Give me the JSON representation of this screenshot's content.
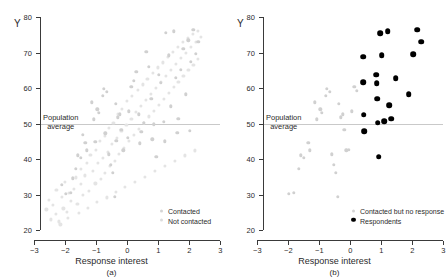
{
  "figure": {
    "background": "#ffffff",
    "panels": [
      {
        "id": "a",
        "caption": "(a)",
        "xlabel": "Response interest",
        "ylabel": "Y",
        "reference_label_line1": "Population",
        "reference_label_line2": "average",
        "legend": [
          {
            "label": "Contacted",
            "marker": "gray-dot",
            "color": "#d0d0d0"
          },
          {
            "label": "Not contacted",
            "marker": "faint-dot",
            "color": "#e4e4e4"
          }
        ]
      },
      {
        "id": "b",
        "caption": "(b)",
        "xlabel": "Response interest",
        "ylabel": "Y",
        "reference_label_line1": "Population",
        "reference_label_line2": "average",
        "legend": [
          {
            "label": "Contacted but no response",
            "marker": "gray-dot",
            "color": "#d0d0d0"
          },
          {
            "label": "Respondents",
            "marker": "black-dot",
            "color": "#000000"
          }
        ]
      }
    ]
  },
  "chart_data": [
    {
      "type": "scatter",
      "panel": "a",
      "title": "",
      "xlabel": "Response interest",
      "ylabel": "Y",
      "xlim": [
        -3,
        3
      ],
      "ylim": [
        20,
        80
      ],
      "xticks": [
        -3,
        -2,
        -1,
        0,
        1,
        2,
        3
      ],
      "xticklabels": [
        "−3",
        "−2",
        "−1",
        "0",
        "1",
        "2",
        "3"
      ],
      "yticks": [
        20,
        30,
        40,
        50,
        60,
        70,
        80
      ],
      "yticklabels": [
        "20",
        "30",
        "40",
        "50",
        "60",
        "70",
        "80"
      ],
      "grid": false,
      "legend_position": "lower-right",
      "annotations": [
        {
          "type": "hline",
          "y": 50,
          "label": "Population average",
          "color": "#c9c9c9"
        }
      ],
      "series": [
        {
          "name": "Not contacted",
          "color": "#e4e4e4",
          "marker": "o",
          "points": [
            [
              -2.45,
              23.0
            ],
            [
              -2.3,
              24.6
            ],
            [
              -2.2,
              22.4
            ],
            [
              -2.05,
              26.1
            ],
            [
              -2.38,
              27.0
            ],
            [
              -2.1,
              29.4
            ],
            [
              -1.95,
              25.0
            ],
            [
              -1.8,
              28.2
            ],
            [
              -1.7,
              31.5
            ],
            [
              -1.6,
              27.4
            ],
            [
              -1.5,
              33.0
            ],
            [
              -1.42,
              29.8
            ],
            [
              -1.35,
              35.4
            ],
            [
              -1.22,
              31.0
            ],
            [
              -1.1,
              36.6
            ],
            [
              -1.02,
              33.1
            ],
            [
              -0.95,
              38.8
            ],
            [
              -0.85,
              34.4
            ],
            [
              -0.78,
              40.4
            ],
            [
              -0.7,
              36.0
            ],
            [
              -0.62,
              42.1
            ],
            [
              -0.55,
              38.0
            ],
            [
              -0.48,
              44.2
            ],
            [
              -0.4,
              39.5
            ],
            [
              -0.32,
              46.0
            ],
            [
              -0.25,
              41.4
            ],
            [
              -0.18,
              47.8
            ],
            [
              -0.1,
              43.2
            ],
            [
              -0.02,
              49.6
            ],
            [
              0.06,
              45.0
            ],
            [
              0.14,
              51.4
            ],
            [
              0.22,
              46.8
            ],
            [
              0.3,
              53.2
            ],
            [
              0.38,
              48.4
            ],
            [
              0.46,
              55.0
            ],
            [
              0.54,
              50.2
            ],
            [
              0.62,
              56.6
            ],
            [
              0.7,
              52.0
            ],
            [
              0.78,
              58.4
            ],
            [
              0.86,
              53.6
            ],
            [
              0.94,
              60.0
            ],
            [
              1.02,
              55.2
            ],
            [
              1.1,
              61.8
            ],
            [
              1.18,
              57.0
            ],
            [
              1.26,
              63.4
            ],
            [
              1.34,
              58.6
            ],
            [
              1.42,
              65.2
            ],
            [
              1.5,
              60.2
            ],
            [
              1.58,
              66.8
            ],
            [
              1.66,
              61.8
            ],
            [
              1.74,
              68.4
            ],
            [
              1.82,
              63.4
            ],
            [
              1.9,
              70.0
            ],
            [
              1.98,
              65.0
            ],
            [
              2.06,
              71.6
            ],
            [
              2.14,
              66.6
            ],
            [
              2.22,
              73.0
            ],
            [
              2.3,
              68.2
            ],
            [
              2.38,
              74.4
            ],
            [
              -2.6,
              25.8
            ],
            [
              -2.52,
              28.4
            ],
            [
              -2.28,
              31.2
            ],
            [
              -2.0,
              33.6
            ],
            [
              -1.88,
              30.4
            ],
            [
              -1.66,
              34.8
            ],
            [
              -1.48,
              37.2
            ],
            [
              -1.3,
              39.0
            ],
            [
              -1.18,
              41.2
            ],
            [
              -1.0,
              42.6
            ],
            [
              -0.88,
              45.0
            ],
            [
              -0.72,
              46.4
            ],
            [
              -0.58,
              48.8
            ],
            [
              -0.44,
              50.2
            ],
            [
              -0.3,
              52.6
            ],
            [
              -0.16,
              54.0
            ],
            [
              0.0,
              56.4
            ],
            [
              0.16,
              57.8
            ],
            [
              0.34,
              59.4
            ],
            [
              0.5,
              61.0
            ],
            [
              0.66,
              62.6
            ],
            [
              0.84,
              64.2
            ],
            [
              1.0,
              65.8
            ],
            [
              1.16,
              67.2
            ],
            [
              1.32,
              68.8
            ],
            [
              1.48,
              70.2
            ],
            [
              1.64,
              71.6
            ],
            [
              1.8,
              73.0
            ],
            [
              1.96,
              74.2
            ],
            [
              2.12,
              75.2
            ],
            [
              2.28,
              76.0
            ],
            [
              -2.15,
              21.6
            ],
            [
              -1.9,
              23.4
            ],
            [
              -1.55,
              24.8
            ],
            [
              -1.25,
              26.2
            ],
            [
              -0.98,
              27.8
            ],
            [
              -0.66,
              29.2
            ],
            [
              -0.36,
              30.8
            ],
            [
              -0.06,
              32.2
            ],
            [
              0.26,
              33.6
            ],
            [
              0.58,
              35.0
            ],
            [
              0.9,
              36.6
            ],
            [
              1.22,
              38.0
            ],
            [
              1.54,
              39.4
            ],
            [
              1.86,
              41.0
            ],
            [
              2.18,
              42.4
            ]
          ]
        },
        {
          "name": "Contacted",
          "color": "#d0d0d0",
          "marker": "o",
          "points": [
            [
              -1.98,
              30.2
            ],
            [
              -1.82,
              30.4
            ],
            [
              -1.66,
              37.3
            ],
            [
              -1.58,
              41.0
            ],
            [
              -1.5,
              40.3
            ],
            [
              -1.34,
              44.5
            ],
            [
              -1.3,
              42.4
            ],
            [
              -1.14,
              56.0
            ],
            [
              -1.08,
              51.2
            ],
            [
              -0.96,
              54.0
            ],
            [
              -0.9,
              53.0
            ],
            [
              -0.78,
              57.8
            ],
            [
              -0.74,
              59.8
            ],
            [
              -0.66,
              58.9
            ],
            [
              -0.58,
              41.3
            ],
            [
              -0.52,
              38.4
            ],
            [
              -0.46,
              36.1
            ],
            [
              -0.4,
              29.3
            ],
            [
              -0.36,
              55.6
            ],
            [
              -0.3,
              51.8
            ],
            [
              -0.24,
              52.6
            ],
            [
              -0.18,
              48.2
            ],
            [
              -0.12,
              42.4
            ],
            [
              0.06,
              53.4
            ],
            [
              0.14,
              60.4
            ],
            [
              0.22,
              62.0
            ],
            [
              0.3,
              64.6
            ],
            [
              0.38,
              52.6
            ],
            [
              0.46,
              47.6
            ],
            [
              0.54,
              50.2
            ],
            [
              0.62,
              70.2
            ],
            [
              0.7,
              66.0
            ],
            [
              0.78,
              57.0
            ],
            [
              0.86,
              49.8
            ],
            [
              0.94,
              40.6
            ],
            [
              1.02,
              63.8
            ],
            [
              1.1,
              61.4
            ],
            [
              1.18,
              50.4
            ],
            [
              1.26,
              75.5
            ],
            [
              1.34,
              69.2
            ],
            [
              1.42,
              54.8
            ],
            [
              1.5,
              76.0
            ],
            [
              1.58,
              62.8
            ],
            [
              1.66,
              51.3
            ],
            [
              1.74,
              65.2
            ],
            [
              1.82,
              71.0
            ],
            [
              1.9,
              58.2
            ],
            [
              1.98,
              73.4
            ],
            [
              2.06,
              67.4
            ],
            [
              2.14,
              76.4
            ],
            [
              2.22,
              69.6
            ],
            [
              2.3,
              73.0
            ],
            [
              -2.1,
              32.8
            ],
            [
              -1.74,
              34.6
            ],
            [
              -1.42,
              46.8
            ],
            [
              -1.02,
              44.8
            ],
            [
              -0.7,
              47.2
            ],
            [
              -0.34,
              45.2
            ],
            [
              0.02,
              46.0
            ],
            [
              0.42,
              44.4
            ],
            [
              0.82,
              45.6
            ],
            [
              1.22,
              45.0
            ],
            [
              1.62,
              47.4
            ],
            [
              2.02,
              48.0
            ]
          ]
        }
      ]
    },
    {
      "type": "scatter",
      "panel": "b",
      "title": "",
      "xlabel": "Response interest",
      "ylabel": "Y",
      "xlim": [
        -3,
        3
      ],
      "ylim": [
        20,
        80
      ],
      "xticks": [
        -3,
        -2,
        -1,
        0,
        1,
        2,
        3
      ],
      "xticklabels": [
        "−3",
        "−2",
        "−1",
        "0",
        "1",
        "2",
        "3"
      ],
      "yticks": [
        20,
        30,
        40,
        50,
        60,
        70,
        80
      ],
      "yticklabels": [
        "20",
        "30",
        "40",
        "50",
        "60",
        "70",
        "80"
      ],
      "grid": false,
      "legend_position": "lower-right",
      "annotations": [
        {
          "type": "hline",
          "y": 50,
          "label": "Population average",
          "color": "#c9c9c9"
        }
      ],
      "series": [
        {
          "name": "Contacted but no response",
          "color": "#d0d0d0",
          "marker": "o",
          "points": [
            [
              -1.98,
              30.2
            ],
            [
              -1.82,
              30.4
            ],
            [
              -1.66,
              37.3
            ],
            [
              -1.58,
              41.0
            ],
            [
              -1.5,
              40.3
            ],
            [
              -1.34,
              44.5
            ],
            [
              -1.3,
              42.4
            ],
            [
              -1.14,
              56.0
            ],
            [
              -1.08,
              51.2
            ],
            [
              -0.96,
              54.0
            ],
            [
              -0.9,
              53.0
            ],
            [
              -0.78,
              57.8
            ],
            [
              -0.74,
              59.8
            ],
            [
              -0.66,
              58.9
            ],
            [
              -0.58,
              41.3
            ],
            [
              -0.52,
              38.4
            ],
            [
              -0.46,
              36.1
            ],
            [
              -0.4,
              29.3
            ],
            [
              -0.36,
              55.6
            ],
            [
              -0.3,
              51.8
            ],
            [
              -0.24,
              52.6
            ],
            [
              -0.18,
              48.2
            ],
            [
              -0.12,
              42.4
            ],
            [
              0.06,
              53.4
            ],
            [
              0.14,
              60.4
            ],
            [
              0.22,
              59.2
            ],
            [
              -0.04,
              42.6
            ]
          ]
        },
        {
          "name": "Respondents",
          "color": "#000000",
          "marker": "o",
          "points": [
            [
              0.42,
              68.8
            ],
            [
              0.42,
              61.7
            ],
            [
              0.44,
              52.5
            ],
            [
              0.46,
              47.9
            ],
            [
              0.84,
              63.8
            ],
            [
              0.86,
              61.4
            ],
            [
              0.88,
              57.0
            ],
            [
              0.9,
              50.2
            ],
            [
              0.92,
              40.7
            ],
            [
              0.98,
              75.4
            ],
            [
              1.02,
              69.2
            ],
            [
              1.1,
              50.6
            ],
            [
              1.22,
              76.0
            ],
            [
              1.26,
              55.2
            ],
            [
              1.32,
              51.4
            ],
            [
              1.48,
              62.8
            ],
            [
              1.9,
              58.3
            ],
            [
              2.04,
              69.6
            ],
            [
              2.16,
              76.4
            ],
            [
              2.3,
              73.0
            ]
          ]
        }
      ]
    }
  ]
}
